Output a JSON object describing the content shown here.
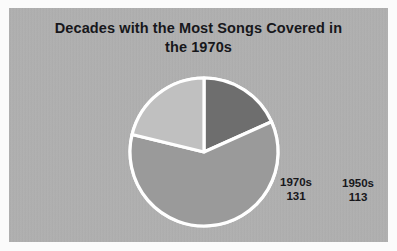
{
  "chart_data": {
    "type": "pie",
    "title": "Decades with the Most Songs Covered in the 1970s",
    "title_lines": [
      "Decades with the Most Songs Covered in",
      "the 1970s"
    ],
    "categories": [
      "1950s",
      "1960s",
      "1970s"
    ],
    "values": [
      113,
      374,
      131
    ],
    "total": 618,
    "xlabel": "",
    "ylabel": "",
    "legend": "none",
    "grid": false,
    "data_labels": "category and value inside slices",
    "start_angle_deg": 0,
    "direction": "clockwise",
    "slices": [
      {
        "label": "1950s",
        "value": 113,
        "percent": 18.3,
        "angle_deg": 65.8,
        "color": "#6e6e6e"
      },
      {
        "label": "1960s",
        "value": 374,
        "percent": 60.5,
        "angle_deg": 217.9,
        "color": "#9a9a9a"
      },
      {
        "label": "1970s",
        "value": 131,
        "percent": 21.2,
        "angle_deg": 76.3,
        "color": "#c0c0c0"
      }
    ]
  },
  "style": {
    "panel_background": "#b3b3b3",
    "frame_background": "#fbfbfb",
    "title_color": "#17171b",
    "label_color": "#17171b",
    "separator_color": "#ffffff"
  }
}
